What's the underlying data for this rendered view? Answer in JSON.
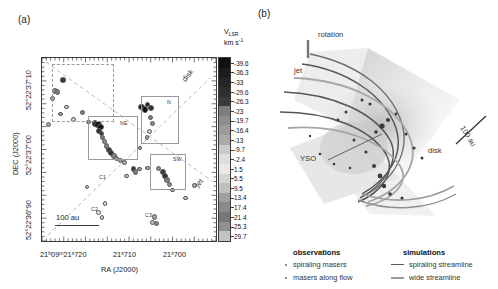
{
  "figure": {
    "panel_a_label": "(a)",
    "panel_b_label": "(b)"
  },
  "panel_a": {
    "xlabel": "RA (J2000)",
    "ylabel": "DEC (J2000)",
    "x_ticklabels": [
      "21ʰ09ᵐ21ˢ720",
      "21ˢ710",
      "21ˢ700"
    ],
    "y_ticklabels": [
      "52°22'37\"10",
      "52°22'37\"00",
      "52°22'36\"90"
    ],
    "scalebar_label": "100 au",
    "annotations": {
      "disk": "disk",
      "jet": "jet"
    },
    "regions": [
      {
        "id": "N",
        "label": "N"
      },
      {
        "id": "NE",
        "label": "NE"
      },
      {
        "id": "SW",
        "label": "SW"
      },
      {
        "id": "C1",
        "label": "C1"
      },
      {
        "id": "C2",
        "label": "C2"
      },
      {
        "id": "C3",
        "label": "C3"
      }
    ]
  },
  "colorbar": {
    "title_main": "V",
    "title_sub": "LSR",
    "title_units": "km s",
    "title_units_exp": "-1",
    "ticklabels": [
      "-39.6",
      "-36.3",
      "-33",
      "-29.6",
      "-26.3",
      "-23",
      "-19.7",
      "-16.4",
      "-13",
      "-9.7",
      "-2.4",
      "1.5",
      "5.5",
      "9.5",
      "13.4",
      "17.4",
      "21.4",
      "25.3",
      "29.7"
    ],
    "colors": [
      "#111111",
      "#1b1b1b",
      "#252525",
      "#2f2f2f",
      "#3a3a3a",
      "#7d7d7d",
      "#8e8e8e",
      "#9c9c9c",
      "#aaaaaa",
      "#c9c9c9",
      "#dedede",
      "#e8e8e8",
      "#d4d4d4",
      "#bfbfbf",
      "#9f9f9f",
      "#8a8a8a",
      "#777777",
      "#8f8f8f",
      "#c2c2c2"
    ]
  },
  "panel_b": {
    "annotations": {
      "rotation": "rotation",
      "jet": "jet",
      "disk": "disk",
      "yso": "YSO",
      "scalebar": "100 au"
    }
  },
  "legend": {
    "observations_header": "observations",
    "simulations_header": "simulations",
    "items_observations": [
      "spiraling masers",
      "masers along flow"
    ],
    "items_simulations": [
      "spiraling streamline",
      "wide streamline"
    ],
    "streamline_colors": [
      "#5a5a5a",
      "#9a9a9a"
    ]
  },
  "chart_data": {
    "type": "scatter",
    "title": "",
    "xlabel": "RA (J2000)",
    "ylabel": "DEC (J2000)",
    "colorbar_label": "V_LSR (km/s)",
    "note": "Water maser spot positions around a young stellar object; grayscale encodes LSR velocity.",
    "masers": [
      {
        "x": 0.115,
        "y": 0.115,
        "v": -26.3,
        "r": 1.6
      },
      {
        "x": 0.07,
        "y": 0.175,
        "v": -19.7,
        "r": 2.0
      },
      {
        "x": 0.083,
        "y": 0.18,
        "v": -23.0,
        "r": 1.7
      },
      {
        "x": 0.052,
        "y": 0.215,
        "v": -13.0,
        "r": 1.5
      },
      {
        "x": 0.135,
        "y": 0.262,
        "v": -9.7,
        "r": 1.3
      },
      {
        "x": 0.1,
        "y": 0.3,
        "v": -16.4,
        "r": 1.4
      },
      {
        "x": 0.03,
        "y": 0.36,
        "v": -13.0,
        "r": 1.5
      },
      {
        "x": 0.175,
        "y": 0.33,
        "v": -9.7,
        "r": 1.2
      },
      {
        "x": 0.225,
        "y": 0.292,
        "v": -23.0,
        "r": 1.4
      },
      {
        "x": 0.262,
        "y": 0.345,
        "v": -19.7,
        "r": 1.3
      },
      {
        "x": 0.3,
        "y": 0.352,
        "v": -33.0,
        "r": 2.2
      },
      {
        "x": 0.316,
        "y": 0.36,
        "v": -36.3,
        "r": 2.6
      },
      {
        "x": 0.33,
        "y": 0.372,
        "v": -39.6,
        "r": 2.3
      },
      {
        "x": 0.322,
        "y": 0.392,
        "v": -29.6,
        "r": 1.9
      },
      {
        "x": 0.336,
        "y": 0.408,
        "v": -26.3,
        "r": 1.8
      },
      {
        "x": 0.344,
        "y": 0.428,
        "v": -23.0,
        "r": 1.6
      },
      {
        "x": 0.352,
        "y": 0.452,
        "v": -19.7,
        "r": 1.7
      },
      {
        "x": 0.366,
        "y": 0.474,
        "v": -23.0,
        "r": 1.8
      },
      {
        "x": 0.378,
        "y": 0.496,
        "v": -26.3,
        "r": 2.0
      },
      {
        "x": 0.392,
        "y": 0.515,
        "v": -29.6,
        "r": 1.9
      },
      {
        "x": 0.408,
        "y": 0.53,
        "v": -23.0,
        "r": 1.7
      },
      {
        "x": 0.424,
        "y": 0.544,
        "v": -19.7,
        "r": 1.5
      },
      {
        "x": 0.444,
        "y": 0.556,
        "v": -16.4,
        "r": 1.4
      },
      {
        "x": 0.47,
        "y": 0.566,
        "v": -13.0,
        "r": 1.3
      },
      {
        "x": 0.568,
        "y": 0.262,
        "v": -36.3,
        "r": 2.4
      },
      {
        "x": 0.584,
        "y": 0.276,
        "v": -39.6,
        "r": 2.1
      },
      {
        "x": 0.6,
        "y": 0.248,
        "v": -33.0,
        "r": 1.8
      },
      {
        "x": 0.62,
        "y": 0.268,
        "v": -29.6,
        "r": 2.3
      },
      {
        "x": 0.618,
        "y": 0.318,
        "v": -23.0,
        "r": 1.5
      },
      {
        "x": 0.628,
        "y": 0.352,
        "v": -19.7,
        "r": 1.6
      },
      {
        "x": 0.612,
        "y": 0.398,
        "v": -9.7,
        "r": 1.4
      },
      {
        "x": 0.598,
        "y": 0.43,
        "v": -13.0,
        "r": 1.3
      },
      {
        "x": 0.52,
        "y": 0.6,
        "v": -26.3,
        "r": 1.9
      },
      {
        "x": 0.53,
        "y": 0.618,
        "v": -23.0,
        "r": 1.6
      },
      {
        "x": 0.556,
        "y": 0.602,
        "v": -16.4,
        "r": 1.3
      },
      {
        "x": 0.6,
        "y": 0.596,
        "v": -13.0,
        "r": 1.4
      },
      {
        "x": 0.662,
        "y": 0.596,
        "v": -19.7,
        "r": 1.5
      },
      {
        "x": 0.69,
        "y": 0.616,
        "v": -26.3,
        "r": 1.8
      },
      {
        "x": 0.7,
        "y": 0.64,
        "v": -29.6,
        "r": 2.0
      },
      {
        "x": 0.712,
        "y": 0.662,
        "v": -23.0,
        "r": 1.7
      },
      {
        "x": 0.726,
        "y": 0.686,
        "v": -19.7,
        "r": 1.5
      },
      {
        "x": 0.746,
        "y": 0.716,
        "v": -13.0,
        "r": 1.4
      },
      {
        "x": 0.82,
        "y": 0.76,
        "v": -9.7,
        "r": 1.3
      },
      {
        "x": 0.356,
        "y": 0.79,
        "v": -2.4,
        "r": 1.3
      },
      {
        "x": 0.318,
        "y": 0.838,
        "v": 1.5,
        "r": 1.4
      },
      {
        "x": 0.34,
        "y": 0.866,
        "v": 5.5,
        "r": 1.3
      },
      {
        "x": 0.64,
        "y": 0.862,
        "v": 13.4,
        "r": 1.8
      },
      {
        "x": 0.628,
        "y": 0.892,
        "v": 9.5,
        "r": 1.4
      },
      {
        "x": 0.65,
        "y": 0.898,
        "v": 17.4,
        "r": 1.5
      },
      {
        "x": 0.252,
        "y": 0.7,
        "v": -9.7,
        "r": 1.2
      },
      {
        "x": 0.556,
        "y": 0.486,
        "v": -16.4,
        "r": 1.2
      },
      {
        "x": 0.48,
        "y": 0.64,
        "v": -9.7,
        "r": 1.2
      },
      {
        "x": 0.87,
        "y": 0.69,
        "v": -13.0,
        "r": 1.3
      }
    ]
  }
}
